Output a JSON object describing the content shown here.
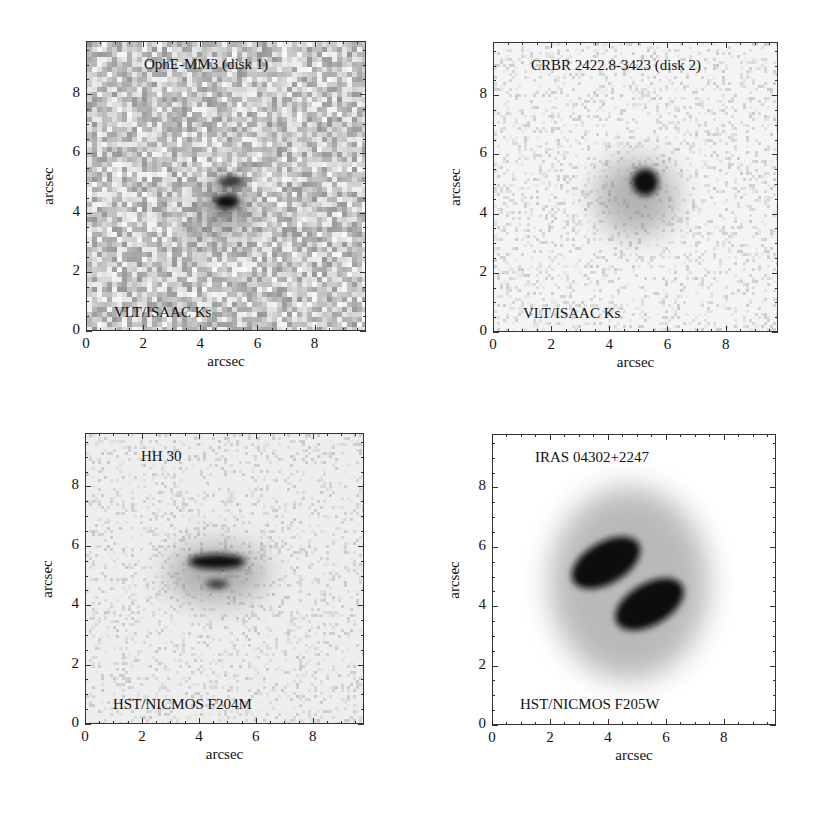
{
  "figure": {
    "panels": [
      {
        "id": "p1",
        "object": "OphE-MM3 (disk 1)",
        "instrument": "VLT/ISAAC Ks",
        "xlabel": "arcsec",
        "ylabel": "arcsec",
        "frame": {
          "left": 86,
          "top": 41,
          "width": 280,
          "height": 290
        },
        "background": "#bdbdbd",
        "noise": "heavy"
      },
      {
        "id": "p2",
        "object": "CRBR 2422.8-3423 (disk 2)",
        "instrument": "VLT/ISAAC Ks",
        "xlabel": "arcsec",
        "ylabel": "arcsec",
        "frame": {
          "left": 493,
          "top": 42,
          "width": 285,
          "height": 290
        },
        "background": "#f4f4f4",
        "noise": "light"
      },
      {
        "id": "p3",
        "object": "HH 30",
        "instrument": "HST/NICMOS F204M",
        "xlabel": "arcsec",
        "ylabel": "arcsec",
        "frame": {
          "left": 85,
          "top": 433,
          "width": 279,
          "height": 291
        },
        "background": "#eeeeee",
        "noise": "light"
      },
      {
        "id": "p4",
        "object": "IRAS 04302+2247",
        "instrument": "HST/NICMOS F205W",
        "xlabel": "arcsec",
        "ylabel": "arcsec",
        "frame": {
          "left": 492,
          "top": 434,
          "width": 284,
          "height": 291
        },
        "background": "#ffffff",
        "noise": "none"
      }
    ],
    "ticks": [
      "0",
      "2",
      "4",
      "6",
      "8"
    ]
  },
  "chart_data": [
    {
      "type": "heatmap",
      "title": "OphE-MM3 (disk 1)",
      "annotation": "VLT/ISAAC Ks",
      "xlabel": "arcsec",
      "ylabel": "arcsec",
      "xlim": [
        0,
        9.8
      ],
      "ylim": [
        0,
        9.8
      ],
      "xticks": [
        0,
        2,
        4,
        6,
        8
      ],
      "yticks": [
        0,
        2,
        4,
        6,
        8
      ],
      "features": [
        {
          "shape": "compact blob",
          "center": [
            4.9,
            4.4
          ],
          "size": [
            0.9,
            0.5
          ],
          "intensity": "peak"
        },
        {
          "shape": "compact blob",
          "center": [
            5.0,
            5.1
          ],
          "size": [
            0.9,
            0.4
          ],
          "intensity": "high"
        },
        {
          "shape": "diffuse halo",
          "center": [
            4.7,
            4.0
          ],
          "size": [
            2.0,
            2.0
          ],
          "intensity": "low"
        }
      ],
      "colormap": "inverted grayscale (dark = bright)",
      "legend": "none"
    },
    {
      "type": "heatmap",
      "title": "CRBR 2422.8-3423 (disk 2)",
      "annotation": "VLT/ISAAC Ks",
      "xlabel": "arcsec",
      "ylabel": "arcsec",
      "xlim": [
        0,
        9.8
      ],
      "ylim": [
        0,
        9.8
      ],
      "xticks": [
        0,
        2,
        4,
        6,
        8
      ],
      "yticks": [
        0,
        2,
        4,
        6,
        8
      ],
      "features": [
        {
          "shape": "compact blob",
          "center": [
            5.2,
            5.1
          ],
          "size": [
            0.9,
            0.9
          ],
          "intensity": "peak"
        },
        {
          "shape": "diffuse halo",
          "center": [
            4.9,
            4.6
          ],
          "size": [
            2.8,
            2.6
          ],
          "intensity": "low"
        }
      ],
      "colormap": "inverted grayscale (dark = bright)",
      "legend": "none"
    },
    {
      "type": "heatmap",
      "title": "HH 30",
      "annotation": "HST/NICMOS F204M",
      "xlabel": "arcsec",
      "ylabel": "arcsec",
      "xlim": [
        0,
        9.8
      ],
      "ylim": [
        0,
        9.8
      ],
      "xticks": [
        0,
        2,
        4,
        6,
        8
      ],
      "yticks": [
        0,
        2,
        4,
        6,
        8
      ],
      "features": [
        {
          "shape": "elongated lobe",
          "center": [
            4.6,
            5.5
          ],
          "size": [
            2.0,
            0.5
          ],
          "intensity": "peak"
        },
        {
          "shape": "small lobe",
          "center": [
            4.6,
            4.75
          ],
          "size": [
            0.8,
            0.3
          ],
          "intensity": "high"
        },
        {
          "shape": "diffuse halo",
          "center": [
            4.6,
            5.1
          ],
          "size": [
            3.5,
            2.0
          ],
          "intensity": "low"
        }
      ],
      "colormap": "inverted grayscale (dark = bright)",
      "legend": "none"
    },
    {
      "type": "heatmap",
      "title": "IRAS 04302+2247",
      "annotation": "HST/NICMOS F205W",
      "xlabel": "arcsec",
      "ylabel": "arcsec",
      "xlim": [
        0,
        9.8
      ],
      "ylim": [
        0,
        9.8
      ],
      "xticks": [
        0,
        2,
        4,
        6,
        8
      ],
      "yticks": [
        0,
        2,
        4,
        6,
        8
      ],
      "features": [
        {
          "shape": "curved lobe",
          "center": [
            3.9,
            5.5
          ],
          "size": [
            2.6,
            1.4
          ],
          "angle_deg": 30,
          "intensity": "peak"
        },
        {
          "shape": "curved lobe",
          "center": [
            5.4,
            4.1
          ],
          "size": [
            2.6,
            1.4
          ],
          "angle_deg": 30,
          "intensity": "peak"
        },
        {
          "shape": "diffuse halo",
          "center": [
            4.7,
            4.8
          ],
          "size": [
            5.5,
            6.5
          ],
          "intensity": "low"
        }
      ],
      "colormap": "inverted grayscale (dark = bright)",
      "legend": "none"
    }
  ]
}
